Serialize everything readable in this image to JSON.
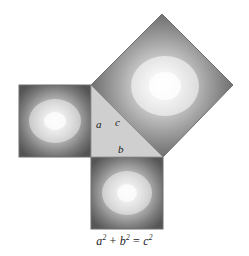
{
  "figure": {
    "background_color": "#ffffff",
    "caption": {
      "full_text": "a² + b² = c²",
      "term_a": "a",
      "term_a_exp": "2",
      "plus": "+",
      "term_b": "b",
      "term_b_exp": "2",
      "equals": "=",
      "term_c": "c",
      "term_c_exp": "2"
    },
    "triangle": {
      "name": "right-triangle",
      "fill_color": "#cfcfcf",
      "vertices": [
        [
          91,
          85
        ],
        [
          91,
          157
        ],
        [
          163,
          157
        ]
      ],
      "labels": {
        "leg_a": "a",
        "leg_b": "b",
        "hypotenuse_c": "c"
      }
    },
    "squares": [
      {
        "id": "square-a",
        "label": "a squared",
        "side_label": "a",
        "orientation": "axis-aligned",
        "center_color": "#ededed",
        "edge_color": "#4f4f4f",
        "corners": [
          [
            19,
            85
          ],
          [
            91,
            85
          ],
          [
            91,
            157
          ],
          [
            19,
            157
          ]
        ],
        "highlight": [
          55,
          121
        ]
      },
      {
        "id": "square-b",
        "label": "b squared",
        "side_label": "b",
        "orientation": "axis-aligned",
        "center_color": "#ededed",
        "edge_color": "#4f4f4f",
        "corners": [
          [
            91,
            157
          ],
          [
            163,
            157
          ],
          [
            163,
            229
          ],
          [
            91,
            229
          ]
        ],
        "highlight": [
          127,
          193
        ]
      },
      {
        "id": "square-c",
        "label": "c squared",
        "side_label": "c",
        "orientation": "rotated-45",
        "center_color": "#f2f2f2",
        "edge_color": "#525252",
        "corners": [
          [
            91,
            85
          ],
          [
            162,
            14
          ],
          [
            233,
            85
          ],
          [
            163,
            157
          ]
        ],
        "highlight": [
          162,
          86
        ]
      }
    ],
    "colors": {
      "background": "#ffffff",
      "triangle_fill": "#cfcfcf",
      "square_dark": "#4f4f4f",
      "square_light": "#efefef",
      "outline": "#6b6b6b",
      "text": "#1a1a1a"
    }
  }
}
